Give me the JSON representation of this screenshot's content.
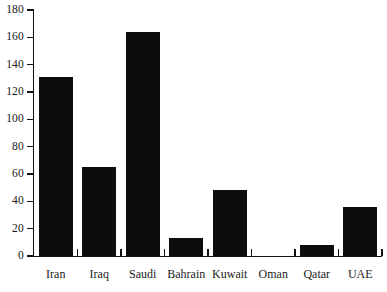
{
  "chart_data": {
    "type": "bar",
    "title": "",
    "xlabel": "",
    "ylabel": "",
    "categories": [
      "Iran",
      "Iraq",
      "Saudi",
      "Bahrain",
      "Kuwait",
      "Oman",
      "Qatar",
      "UAE"
    ],
    "values": [
      131,
      65,
      164,
      13,
      48,
      0,
      8,
      36
    ],
    "ylim": [
      0,
      180
    ],
    "ytick_labels": [
      "0",
      "20",
      "40",
      "60",
      "80",
      "100",
      "120",
      "140",
      "160",
      "180"
    ],
    "ytick_values": [
      0,
      20,
      40,
      60,
      80,
      100,
      120,
      140,
      160,
      180
    ],
    "grid": false,
    "legend": null,
    "bar_color": "#0d0d0d",
    "axis_color": "#111111",
    "background_color": "#ffffff"
  },
  "axes": {
    "y_axis_name": "y-axis",
    "x_axis_name": "x-axis"
  }
}
